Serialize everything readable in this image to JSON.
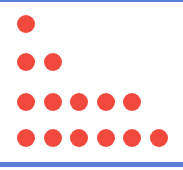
{
  "figure": {
    "dot_color": "#f2493f",
    "border_color": "#5b7fd9",
    "rows": [
      {
        "count": 1
      },
      {
        "count": 2
      },
      {
        "count": 5
      },
      {
        "count": 6
      }
    ]
  }
}
